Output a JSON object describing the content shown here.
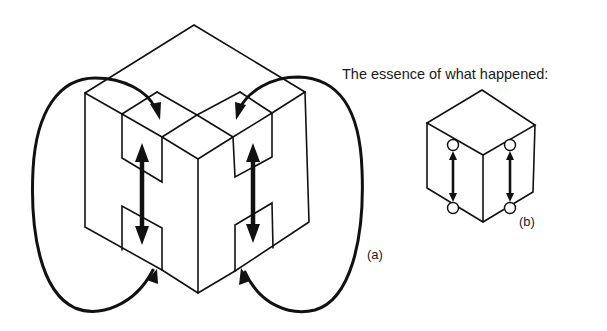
{
  "figure": {
    "heading": "The essence of what happened:",
    "panel_a": {
      "label": "(a)",
      "description": "Large isometric cube with notched slabs; two double-headed vertical arrows and two curved loop arrows"
    },
    "panel_b": {
      "label": "(b)",
      "description": "Small isometric cube with four circle nodes connected by two double-headed vertical arrows"
    }
  },
  "colors": {
    "ink": "#111111",
    "background": "#ffffff"
  }
}
